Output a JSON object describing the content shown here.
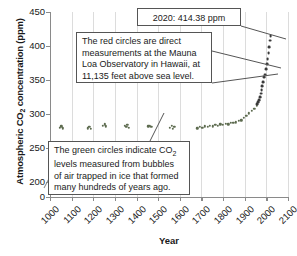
{
  "chart_data": {
    "type": "scatter",
    "title": "",
    "xlabel": "Year",
    "ylabel": "Atmospheric CO2 concentration (ppm)",
    "ylabel_rich": "Atmospheric CO₂ concentration (ppm)",
    "xlim": [
      1000,
      2100
    ],
    "ylim": [
      0,
      450
    ],
    "y_axis_break": true,
    "y_axis_break_range": [
      0,
      200
    ],
    "yticks": [
      0,
      200,
      250,
      300,
      350,
      400,
      450
    ],
    "ytick_labels": [
      "0",
      "200",
      "250",
      "300",
      "350",
      "400",
      "450"
    ],
    "xticks": [
      1000,
      1100,
      1200,
      1300,
      1400,
      1500,
      1600,
      1700,
      1800,
      1900,
      2000,
      2100
    ],
    "xtick_labels": [
      "1000",
      "1100",
      "1200",
      "1300",
      "1400",
      "1500",
      "1600",
      "1700",
      "1800",
      "1900",
      "2000",
      "2100"
    ],
    "grid": "vertical",
    "legend": "none",
    "series": [
      {
        "name": "Ice core bubble measurements (green circles)",
        "color": "#5d6b4f",
        "marker": "circle",
        "points": [
          [
            1045,
            280
          ],
          [
            1052,
            282
          ],
          [
            1058,
            279
          ],
          [
            1175,
            279
          ],
          [
            1182,
            281
          ],
          [
            1188,
            278
          ],
          [
            1245,
            283
          ],
          [
            1252,
            285
          ],
          [
            1259,
            282
          ],
          [
            1345,
            283
          ],
          [
            1352,
            281
          ],
          [
            1358,
            284
          ],
          [
            1364,
            280
          ],
          [
            1455,
            282
          ],
          [
            1462,
            283
          ],
          [
            1468,
            281
          ],
          [
            1555,
            280
          ],
          [
            1562,
            283
          ],
          [
            1568,
            278
          ],
          [
            1574,
            281
          ],
          [
            1680,
            279
          ],
          [
            1692,
            281
          ],
          [
            1704,
            280
          ],
          [
            1716,
            282
          ],
          [
            1728,
            281
          ],
          [
            1740,
            283
          ],
          [
            1752,
            282
          ],
          [
            1764,
            284
          ],
          [
            1776,
            283
          ],
          [
            1788,
            285
          ],
          [
            1800,
            284
          ],
          [
            1812,
            286
          ],
          [
            1824,
            285
          ],
          [
            1836,
            287
          ],
          [
            1848,
            287
          ],
          [
            1860,
            288
          ],
          [
            1872,
            290
          ],
          [
            1884,
            291
          ],
          [
            1896,
            294
          ],
          [
            1908,
            297
          ],
          [
            1920,
            301
          ],
          [
            1932,
            305
          ],
          [
            1944,
            308
          ],
          [
            1956,
            312
          ]
        ]
      },
      {
        "name": "Direct measurements, Mauna Loa Observatory (red circles)",
        "color": "#3a3a3a",
        "marker": "circle",
        "points": [
          [
            1958,
            315
          ],
          [
            1962,
            318
          ],
          [
            1966,
            321
          ],
          [
            1970,
            325
          ],
          [
            1974,
            330
          ],
          [
            1978,
            335
          ],
          [
            1982,
            341
          ],
          [
            1986,
            347
          ],
          [
            1990,
            354
          ],
          [
            1994,
            358
          ],
          [
            1998,
            366
          ],
          [
            2002,
            373
          ],
          [
            2006,
            381
          ],
          [
            2010,
            389
          ],
          [
            2014,
            398
          ],
          [
            2018,
            408
          ],
          [
            2020,
            414.38
          ]
        ]
      }
    ],
    "annotations": [
      {
        "name": "2020-value-callout",
        "text": "2020: 414.38 ppm",
        "points_to": [
          2020,
          414.38
        ]
      },
      {
        "name": "red-circles-callout",
        "text": "The red circles are direct measurements at the Mauna Loa Observatory in Hawaii, at 11,135 feet above sea level.",
        "points_to": [
          2000,
          370
        ]
      },
      {
        "name": "green-circles-callout",
        "text": "The green circles indicate CO2 levels measured from bubbles of air trapped in ice that formed many hundreds of years ago.",
        "text_rich": "The green circles indicate CO₂ levels measured from bubbles of air trapped in ice that formed many hundreds of years ago.",
        "points_to": [
          1360,
          282
        ]
      }
    ]
  },
  "callouts": {
    "value_2020": "2020: 414.38 ppm",
    "red_line1": "The red circles are direct",
    "red_line2": "measurements at the Mauna",
    "red_line3": "Loa Observatory in Hawaii, at",
    "red_line4": "11,135 feet above sea level.",
    "green_line1_a": "The green circles indicate CO",
    "green_line1_sub": "2",
    "green_line2": "levels measured from bubbles",
    "green_line3": "of air trapped in ice that formed",
    "green_line4": "many hundreds of years ago."
  },
  "axes": {
    "x_title": "Year",
    "y_title_a": "Atmospheric CO",
    "y_title_sub": "2",
    "y_title_b": " concentration (ppm)"
  }
}
